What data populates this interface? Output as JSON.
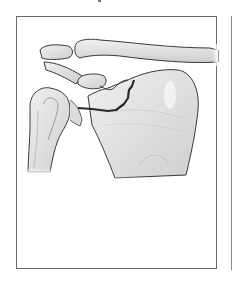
{
  "figure": {
    "caption": "",
    "structures": [
      {
        "name": "clavicle"
      },
      {
        "name": "acromion"
      },
      {
        "name": "coracoid-process"
      },
      {
        "name": "humeral-head"
      },
      {
        "name": "scapula-body"
      },
      {
        "name": "fracture-line"
      }
    ],
    "colors": {
      "bone_fill": "#e4e4e4",
      "bone_shadow": "#c9c9c9",
      "outline": "#3a3a3a",
      "fracture": "#2b2b2b",
      "frame_border": "#6a6a6a"
    }
  }
}
